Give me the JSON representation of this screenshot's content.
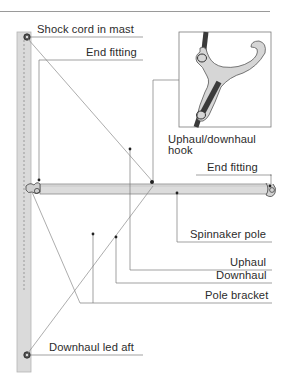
{
  "figure": {
    "labels": {
      "shock_cord": "Shock cord in mast",
      "end_fitting_top": "End fitting",
      "hook_line1": "Uphaul/downhaul",
      "hook_line2": "hook",
      "end_fitting_right": "End fitting",
      "spinnaker_pole": "Spinnaker pole",
      "uphaul": "Uphaul",
      "downhaul": "Downhaul",
      "pole_bracket": "Pole bracket",
      "downhaul_led_aft": "Downhaul led aft"
    },
    "colors": {
      "mast_fill": "#d9d9d9",
      "pole_fill": "#dcdcdc",
      "line": "#7a7a7a",
      "hook_fill": "#d6d6d6",
      "rope": "#3a3a3a",
      "text": "#2c2c2c"
    }
  }
}
